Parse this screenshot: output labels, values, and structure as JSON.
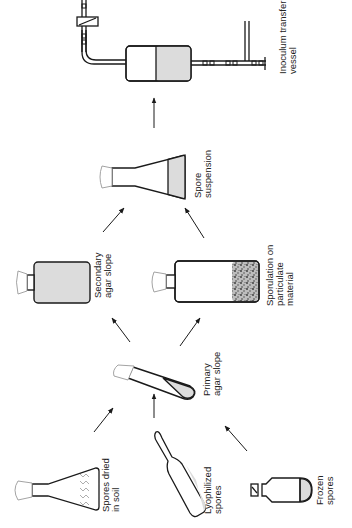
{
  "diagram": {
    "type": "process-flow",
    "orientation": "rotated-90",
    "colors": {
      "line": "#1a1a1a",
      "fill_agar": "#dcdcdc",
      "background": "#ffffff"
    },
    "nodes": [
      {
        "id": "soil",
        "label_line1": "Spores dried",
        "label_line2": "in soil",
        "shape": "conical-flask-with-soil"
      },
      {
        "id": "lyophilized",
        "label_line1": "Lyophilized",
        "label_line2": "spores",
        "shape": "ampoule"
      },
      {
        "id": "frozen",
        "label_line1": "Frozen",
        "label_line2": "spores",
        "shape": "vial"
      },
      {
        "id": "primary",
        "label_line1": "Primary",
        "label_line2": "agar slope",
        "shape": "test-tube-slant"
      },
      {
        "id": "secondary",
        "label_line1": "Secondary",
        "label_line2": "agar slope",
        "shape": "flat-bottle"
      },
      {
        "id": "sporulation",
        "label_line1": "Sporulation on",
        "label_line2": "particulate",
        "label_line3": "material",
        "shape": "bottle-with-particulate"
      },
      {
        "id": "suspension",
        "label_line1": "Spore",
        "label_line2": "suspension",
        "shape": "conical-flask-liquid"
      },
      {
        "id": "transfer",
        "label_line1": "Inoculum transfer",
        "label_line2": "vessel",
        "shape": "vessel-with-pipes"
      }
    ],
    "edges": [
      {
        "from": "soil",
        "to": "primary"
      },
      {
        "from": "lyophilized",
        "to": "primary"
      },
      {
        "from": "frozen",
        "to": "primary"
      },
      {
        "from": "primary",
        "to": "secondary"
      },
      {
        "from": "primary",
        "to": "sporulation"
      },
      {
        "from": "secondary",
        "to": "suspension"
      },
      {
        "from": "sporulation",
        "to": "suspension"
      },
      {
        "from": "suspension",
        "to": "transfer"
      }
    ]
  }
}
